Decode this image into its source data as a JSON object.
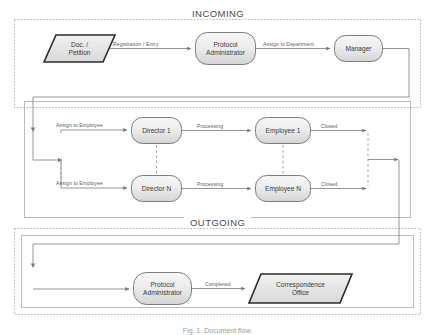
{
  "figure": {
    "caption": "Fig. 1. Document flow.",
    "background": "#ffffff"
  },
  "sections": [
    {
      "id": "incoming",
      "label": "INCOMING",
      "border_style": "dashed"
    },
    {
      "id": "assignment",
      "label": "",
      "border_style": "solid"
    },
    {
      "id": "outgoing",
      "label": "OUTGOING",
      "border_style": "dashed"
    }
  ],
  "nodes": [
    {
      "id": "doc-petition",
      "label": "Doc. /\nPetition",
      "shape": "parallelogram",
      "section": "incoming"
    },
    {
      "id": "protocol-administrator-in",
      "label": "Protocol\nAdministrator",
      "shape": "rounded-rect",
      "section": "incoming"
    },
    {
      "id": "manager",
      "label": "Manager",
      "shape": "rounded-rect",
      "section": "incoming"
    },
    {
      "id": "director-1",
      "label": "Director 1",
      "shape": "rounded-rect",
      "section": "assignment"
    },
    {
      "id": "director-n",
      "label": "Director N",
      "shape": "rounded-rect",
      "section": "assignment"
    },
    {
      "id": "employee-1",
      "label": "Employee 1",
      "shape": "rounded-rect",
      "section": "assignment"
    },
    {
      "id": "employee-n",
      "label": "Employee  N",
      "shape": "rounded-rect",
      "section": "assignment"
    },
    {
      "id": "protocol-administrator-out",
      "label": "Protocol\nAdministrator",
      "shape": "rounded-rect",
      "section": "outgoing"
    },
    {
      "id": "correspondence-office",
      "label": "Correspondence\nOffice",
      "shape": "parallelogram",
      "section": "outgoing"
    }
  ],
  "edges": [
    {
      "id": "e1",
      "from": "doc-petition",
      "to": "protocol-administrator-in",
      "label": "Registration / Entry"
    },
    {
      "id": "e2",
      "from": "protocol-administrator-in",
      "to": "manager",
      "label": "Assign to Department"
    },
    {
      "id": "e3",
      "from": "manager",
      "to": "director-1",
      "label": "Assign to Employee"
    },
    {
      "id": "e4",
      "from": "manager",
      "to": "director-n",
      "label": "Assign to Employee"
    },
    {
      "id": "e5",
      "from": "director-1",
      "to": "employee-1",
      "label": "Processing"
    },
    {
      "id": "e6",
      "from": "director-n",
      "to": "employee-n",
      "label": "Processing"
    },
    {
      "id": "e7",
      "from": "employee-1",
      "to": "outgoing",
      "label": "Closed"
    },
    {
      "id": "e8",
      "from": "employee-n",
      "to": "outgoing",
      "label": "Closed"
    },
    {
      "id": "e9",
      "from": "protocol-administrator-out",
      "to": "correspondence-office",
      "label": "Completed"
    }
  ],
  "colors": {
    "node_fill_top": "#f4f4f4",
    "node_fill_bottom": "#d9d9d9",
    "node_stroke": "#7d7d7d",
    "parallelogram_stroke": "#2b2b2b",
    "connector": "#8a8a8a",
    "container_dashed": "#b4b4b4",
    "container_solid": "#b9b9b9",
    "text": "#3a3a3a",
    "edge_text": "#5b5b5b"
  }
}
